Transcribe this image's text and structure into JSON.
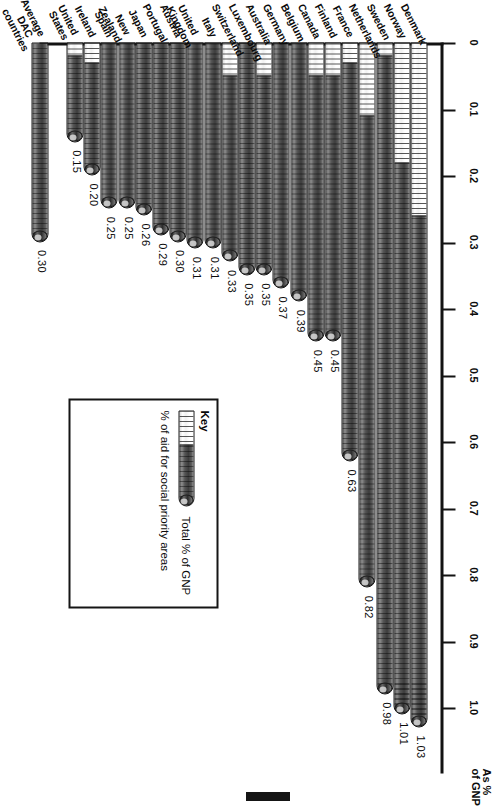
{
  "axis": {
    "title": "As %\nof GNP",
    "ticks": [
      "0",
      "0.1",
      "0.2",
      "0.3",
      "0.4",
      "0.5",
      "0.6",
      "0.7",
      "0.8",
      "0.9",
      "1.0"
    ]
  },
  "legend": {
    "title": "Key",
    "series_total": "Total % of GNP",
    "series_social": "% of aid for social priority areas"
  },
  "colors": {
    "bar_dark": "#4a4a4a",
    "bar_light": "#ffffff",
    "outline": "#1a1a1a",
    "text": "#0b0b0b"
  },
  "chart_data": {
    "type": "bar",
    "title": "",
    "xlabel": "As % of GNP",
    "ylabel": "",
    "xlim": [
      0,
      1.1
    ],
    "grid": false,
    "orientation": "horizontal",
    "legend_position": "inside-right",
    "categories": [
      "Denmark",
      "Norway",
      "Sweden",
      "Netherlands",
      "France",
      "Finland",
      "Canada",
      "Belgium",
      "Germany",
      "Australia",
      "Luxembourg",
      "Switzerland",
      "Italy",
      "United Kingdom",
      "Austria",
      "Portugal",
      "Japan",
      "New Zealand",
      "Spain",
      "Ireland",
      "United States",
      "Average DAC\ncountries"
    ],
    "series": [
      {
        "name": "Total % of GNP",
        "values": [
          1.03,
          1.01,
          0.98,
          0.82,
          0.63,
          0.45,
          0.45,
          0.39,
          0.37,
          0.35,
          0.35,
          0.33,
          0.31,
          0.31,
          0.3,
          0.29,
          0.26,
          0.25,
          0.25,
          0.2,
          0.15,
          0.3
        ]
      },
      {
        "name": "% of aid for social priority areas",
        "values": [
          0.26,
          0.18,
          0.02,
          0.11,
          0.03,
          0.05,
          0.05,
          0.0,
          0.0,
          0.05,
          0.0,
          0.05,
          0.0,
          0.0,
          0.0,
          0.0,
          0.0,
          0.0,
          0.0,
          0.03,
          0.02,
          0.0
        ]
      }
    ],
    "data_labels": [
      "1.03",
      "1.01",
      "0.98",
      "0.82",
      "0.63",
      "0.45",
      "0.45",
      "0.39",
      "0.37",
      "0.35",
      "0.35",
      "0.33",
      "0.31",
      "0.31",
      "0.30",
      "0.29",
      "0.26",
      "0.25",
      "0.25",
      "0.20",
      "0.15",
      "0.30"
    ]
  }
}
